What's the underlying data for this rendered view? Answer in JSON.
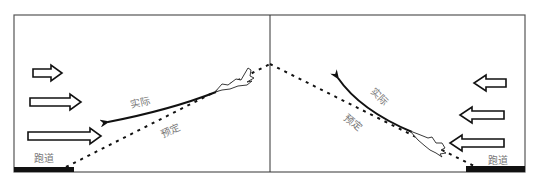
{
  "panels": [
    {
      "id": "left",
      "runway_label": "跑道",
      "actual_label": "实际",
      "planned_label": "预定",
      "wind_direction": "left-to-right"
    },
    {
      "id": "right",
      "runway_label": "跑道",
      "actual_label": "实际",
      "planned_label": "预定",
      "wind_direction": "right-to-left"
    }
  ],
  "colors": {
    "frame": "#555555",
    "runway": "#111111",
    "label": "#777777",
    "path": "#111111"
  }
}
